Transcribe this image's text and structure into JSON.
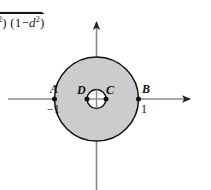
{
  "figure": {
    "title_formula": {
      "prefix_sup": "2",
      "text_after": ") (1",
      "minus": "−",
      "var": "d",
      "var_sup": "2",
      "close": ")",
      "full": "²) (1−d²)"
    },
    "axes": {
      "x_axis_name": "x-axis",
      "y_axis_name": "y-axis",
      "x_arrow": "arrow-right",
      "y_arrow": "arrow-up",
      "origin_x": 96.5,
      "origin_y": 99,
      "x_start": 8,
      "x_end": 195,
      "y_start": 17,
      "y_end": 190
    },
    "shape": {
      "type": "annulus",
      "outer_radius_px": 42,
      "inner_radius_px": 9.5,
      "fill_color": "#cccccc",
      "stroke_color": "#111111",
      "inner_fill_color": "#ffffff"
    },
    "points": [
      {
        "id": "A",
        "label": "A",
        "value_label": "−1",
        "x": 54.5,
        "y": 99
      },
      {
        "id": "D",
        "label": "D",
        "value_label": "",
        "x": 87.0,
        "y": 99
      },
      {
        "id": "C",
        "label": "C",
        "value_label": "",
        "x": 106.0,
        "y": 99
      },
      {
        "id": "B",
        "label": "B",
        "value_label": "1",
        "x": 138.5,
        "y": 99
      }
    ],
    "colors": {
      "background": "#ffffff",
      "ink": "#111111",
      "axis": "#8a8a8a",
      "shade": "#cccccc"
    }
  }
}
